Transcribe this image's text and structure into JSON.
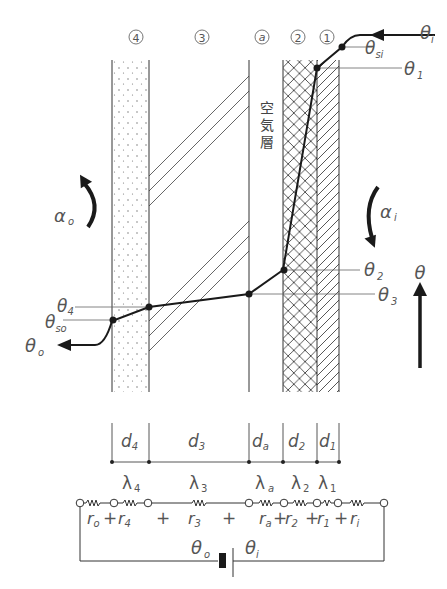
{
  "diagram": {
    "layers": [
      {
        "id": "4",
        "marker": "④",
        "pattern": "dotted",
        "thickness_label": "d",
        "thickness_sub": "4",
        "conductivity_label": "λ",
        "conductivity_sub": "4",
        "resistance_label": "r",
        "resistance_sub": "4"
      },
      {
        "id": "3",
        "marker": "③",
        "pattern": "sparse-diagonal",
        "thickness_label": "d",
        "thickness_sub": "3",
        "conductivity_label": "λ",
        "conductivity_sub": "3",
        "resistance_label": "r",
        "resistance_sub": "3"
      },
      {
        "id": "a",
        "marker": "ⓐ",
        "pattern": "air",
        "thickness_label": "d",
        "thickness_sub": "a",
        "conductivity_label": "λ",
        "conductivity_sub": "a",
        "resistance_label": "r",
        "resistance_sub": "a"
      },
      {
        "id": "2",
        "marker": "②",
        "pattern": "crosshatch",
        "thickness_label": "d",
        "thickness_sub": "2",
        "conductivity_label": "λ",
        "conductivity_sub": "2",
        "resistance_label": "r",
        "resistance_sub": "2"
      },
      {
        "id": "1",
        "marker": "①",
        "pattern": "diagonal",
        "thickness_label": "d",
        "thickness_sub": "1",
        "conductivity_label": "λ",
        "conductivity_sub": "1",
        "resistance_label": "r",
        "resistance_sub": "1"
      }
    ],
    "air_layer_label": [
      "空",
      "気",
      "層"
    ],
    "temperatures": {
      "theta_i": {
        "sym": "θ",
        "sub": "i"
      },
      "theta_si": {
        "sym": "θ",
        "sub": "si"
      },
      "theta_1": {
        "sym": "θ",
        "sub": "1"
      },
      "theta_2": {
        "sym": "θ",
        "sub": "2"
      },
      "theta_3": {
        "sym": "θ",
        "sub": "3"
      },
      "theta_4": {
        "sym": "θ",
        "sub": "4"
      },
      "theta_so": {
        "sym": "θ",
        "sub": "so"
      },
      "theta_o": {
        "sym": "θ",
        "sub": "o"
      }
    },
    "heat_transfer_coefficients": {
      "alpha_o": {
        "sym": "α",
        "sub": "o"
      },
      "alpha_i": {
        "sym": "α",
        "sub": "i"
      }
    },
    "axis_label": {
      "sym": "θ"
    },
    "circuit": {
      "resistances": [
        {
          "sym": "r",
          "sub": "o"
        },
        {
          "op": "+"
        },
        {
          "sym": "r",
          "sub": "4"
        },
        {
          "op": "+"
        },
        {
          "sym": "r",
          "sub": "3"
        },
        {
          "op": "+"
        },
        {
          "sym": "r",
          "sub": "a"
        },
        {
          "op": "+"
        },
        {
          "sym": "r",
          "sub": "2"
        },
        {
          "op": "+"
        },
        {
          "sym": "r",
          "sub": "1"
        },
        {
          "op": "+"
        },
        {
          "sym": "r",
          "sub": "i"
        }
      ],
      "battery_left": {
        "sym": "θ",
        "sub": "o"
      },
      "battery_right": {
        "sym": "θ",
        "sub": "i"
      }
    },
    "colors": {
      "line": "#333333",
      "text": "#555555",
      "profile": "#1a1a1a"
    }
  }
}
